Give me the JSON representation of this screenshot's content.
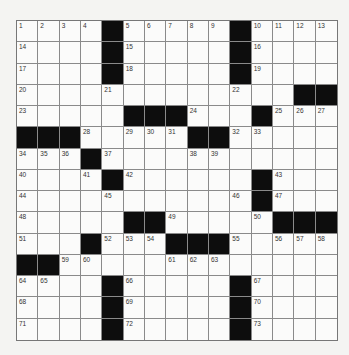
{
  "puzzle": {
    "rows": 15,
    "cols": 15,
    "colors": {
      "background": "#f4f4f2",
      "cell": "#fbfbfa",
      "block": "#0d0d0d",
      "gridline": "#8a8a8a",
      "number": "#333333"
    },
    "grid": [
      [
        "1",
        "2",
        "3",
        "4",
        "#",
        "5",
        "6",
        "7",
        "8",
        "9",
        "#",
        "10",
        "11",
        "12",
        "13"
      ],
      [
        "14",
        ".",
        ".",
        ".",
        "#",
        "15",
        ".",
        ".",
        ".",
        ".",
        "#",
        "16",
        ".",
        ".",
        "."
      ],
      [
        "17",
        ".",
        ".",
        ".",
        "#",
        "18",
        ".",
        ".",
        ".",
        ".",
        "#",
        "19",
        ".",
        ".",
        "."
      ],
      [
        "20",
        ".",
        ".",
        ".",
        "21",
        ".",
        ".",
        ".",
        ".",
        ".",
        "22",
        ".",
        ".",
        "#",
        "#"
      ],
      [
        "23",
        ".",
        ".",
        ".",
        ".",
        "#",
        "#",
        "#",
        "24",
        ".",
        ".",
        "#",
        "25",
        "26",
        "27"
      ],
      [
        "#",
        "#",
        "#",
        "28",
        ".",
        "29",
        "30",
        "31",
        "#",
        "#",
        "32",
        "33",
        ".",
        ".",
        "."
      ],
      [
        "34",
        "35",
        "36",
        "#",
        "37",
        ".",
        ".",
        ".",
        "38",
        "39",
        ".",
        ".",
        ".",
        ".",
        "."
      ],
      [
        "40",
        ".",
        ".",
        "41",
        "#",
        "42",
        ".",
        ".",
        ".",
        ".",
        ".",
        "#",
        "43",
        ".",
        "."
      ],
      [
        "44",
        ".",
        ".",
        ".",
        "45",
        ".",
        ".",
        ".",
        ".",
        ".",
        "46",
        "#",
        "47",
        ".",
        "."
      ],
      [
        "48",
        ".",
        ".",
        ".",
        ".",
        "#",
        "#",
        "49",
        ".",
        ".",
        ".",
        "50",
        "#",
        "#",
        "#"
      ],
      [
        "51",
        ".",
        ".",
        "#",
        "52",
        "53",
        "54",
        "#",
        "#",
        "#",
        "55",
        ".",
        "56",
        "57",
        "58"
      ],
      [
        "#",
        "#",
        "59",
        "60",
        ".",
        ".",
        ".",
        "61",
        "62",
        "63",
        ".",
        ".",
        ".",
        ".",
        "."
      ],
      [
        "64",
        "65",
        ".",
        ".",
        "#",
        "66",
        ".",
        ".",
        ".",
        ".",
        "#",
        "67",
        ".",
        ".",
        "."
      ],
      [
        "68",
        ".",
        ".",
        ".",
        "#",
        "69",
        ".",
        ".",
        ".",
        ".",
        "#",
        "70",
        ".",
        ".",
        "."
      ],
      [
        "71",
        ".",
        ".",
        ".",
        "#",
        "72",
        ".",
        ".",
        ".",
        ".",
        "#",
        "73",
        ".",
        ".",
        "."
      ]
    ]
  }
}
